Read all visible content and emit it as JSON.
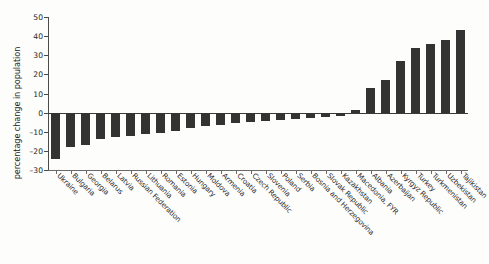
{
  "chart_data": {
    "type": "bar",
    "title": "",
    "subtitle": "",
    "xlabel": "",
    "ylabel": "percentage change in population",
    "ylim": [
      -30,
      50
    ],
    "yticks": [
      50,
      40,
      30,
      20,
      10,
      0,
      -10,
      -20,
      -30
    ],
    "ytick_labels": [
      "50",
      "40",
      "30",
      "20",
      "10",
      "0",
      "–10",
      "–20",
      "–30"
    ],
    "grid": false,
    "legend": null,
    "bar_color": "#333333",
    "axis_color": "#4a4a4a",
    "categories": [
      "Ukraine",
      "Bulgaria",
      "Georgia",
      "Belarus",
      "Latvia",
      "Russian Federation",
      "Lithuania",
      "Romania",
      "Estonia",
      "Hungary",
      "Moldova",
      "Armenia",
      "Croatia",
      "Czech Republic",
      "Slovenia",
      "Poland",
      "Serbia",
      "Bosnia and Herzegovina",
      "Slovak Republic",
      "Kazakhstan",
      "Macedonia, FYR",
      "Albania",
      "Azerbaijan",
      "Kyrgyz Republic",
      "Turkey",
      "Turkmenistan",
      "Uzbekistan",
      "Tajikistan"
    ],
    "values": [
      -24,
      -18,
      -17,
      -14,
      -13,
      -12,
      -11,
      -10.5,
      -9.5,
      -8,
      -7,
      -6.5,
      -5.5,
      -5,
      -4.5,
      -4,
      -3.5,
      -3,
      -2.5,
      -2,
      1.5,
      13,
      17,
      27,
      34,
      36,
      38,
      43
    ]
  }
}
